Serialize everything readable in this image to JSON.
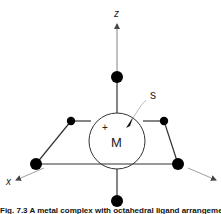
{
  "diagram": {
    "labels": {
      "z_axis": "z",
      "x_axis": "x",
      "spin": "s",
      "center": "M",
      "charge": "+"
    },
    "caption": "Fig. 7.3 A metal complex with octahedral ligand arrangement",
    "colors": {
      "line": "#333333",
      "atom": "#000000",
      "arrow": "#555555",
      "background": "#ffffff"
    },
    "nodes": [
      {
        "name": "top-ligand",
        "cx": 117,
        "cy": 77,
        "r": 6
      },
      {
        "name": "bottom-ligand",
        "cx": 117,
        "cy": 201,
        "r": 6
      },
      {
        "name": "back-left-ligand",
        "cx": 71,
        "cy": 121,
        "r": 4
      },
      {
        "name": "back-right-ligand",
        "cx": 164,
        "cy": 121,
        "r": 4
      },
      {
        "name": "front-left-ligand",
        "cx": 36,
        "cy": 164,
        "r": 6
      },
      {
        "name": "front-right-ligand",
        "cx": 178,
        "cy": 164,
        "r": 6
      }
    ],
    "center_atom": {
      "cx": 117,
      "cy": 141,
      "r": 28
    }
  }
}
